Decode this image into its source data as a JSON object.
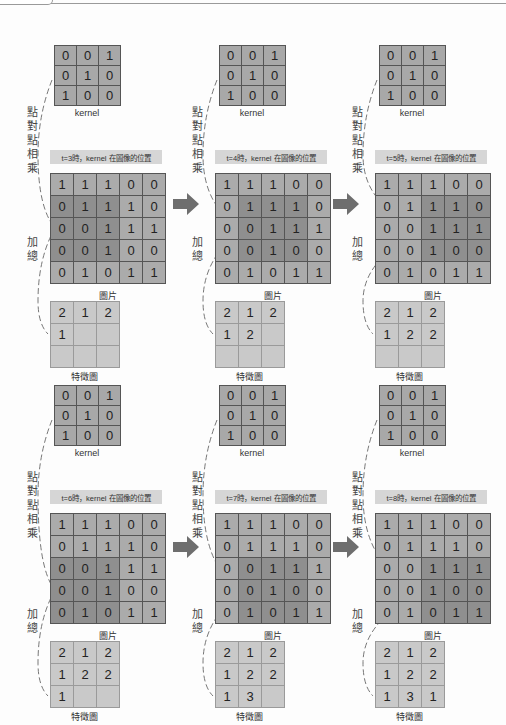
{
  "labels": {
    "kernel": "kernel",
    "image": "圖片",
    "feature_map": "特徵圖",
    "multiply": [
      "點",
      "對",
      "點",
      "相",
      "乘"
    ],
    "sum": [
      "加",
      "總"
    ]
  },
  "kernel_values": [
    [
      0,
      0,
      1
    ],
    [
      0,
      1,
      0
    ],
    [
      1,
      0,
      0
    ]
  ],
  "image_values": [
    [
      1,
      1,
      1,
      0,
      0
    ],
    [
      0,
      1,
      1,
      1,
      0
    ],
    [
      0,
      0,
      1,
      1,
      1
    ],
    [
      0,
      0,
      1,
      0,
      0
    ],
    [
      0,
      1,
      0,
      1,
      1
    ]
  ],
  "colors": {
    "kernel_cell": "#a8a8a8",
    "image_cell": "#ababab",
    "image_highlight": "#8f8f8f",
    "feature_cell": "#c9c9c9",
    "caption_bg": "#d6d6d6",
    "arrow": "#6e6e6e"
  },
  "panels": [
    {
      "caption": "t=3時，kernel 在圖像的位置",
      "window": [
        1,
        0
      ],
      "feature": [
        [
          "2",
          "1",
          "2"
        ],
        [
          "1",
          "",
          ""
        ],
        [
          "",
          "",
          ""
        ]
      ]
    },
    {
      "caption": "t=4時，kernel 在圖像的位置",
      "window": [
        1,
        1
      ],
      "feature": [
        [
          "2",
          "1",
          "2"
        ],
        [
          "1",
          "2",
          ""
        ],
        [
          "",
          "",
          ""
        ]
      ]
    },
    {
      "caption": "t=5時，kernel 在圖像的位置",
      "window": [
        1,
        2
      ],
      "feature": [
        [
          "2",
          "1",
          "2"
        ],
        [
          "1",
          "2",
          "2"
        ],
        [
          "",
          "",
          ""
        ]
      ]
    },
    {
      "caption": "t=6時，kernel 在圖像的位置",
      "window": [
        2,
        0
      ],
      "feature": [
        [
          "2",
          "1",
          "2"
        ],
        [
          "1",
          "2",
          "2"
        ],
        [
          "1",
          "",
          ""
        ]
      ]
    },
    {
      "caption": "t=7時，kernel 在圖像的位置",
      "window": [
        2,
        1
      ],
      "feature": [
        [
          "2",
          "1",
          "2"
        ],
        [
          "1",
          "2",
          "2"
        ],
        [
          "1",
          "3",
          ""
        ]
      ]
    },
    {
      "caption": "t=8時，kernel 在圖像的位置",
      "window": [
        2,
        2
      ],
      "feature": [
        [
          "2",
          "1",
          "2"
        ],
        [
          "1",
          "2",
          "2"
        ],
        [
          "1",
          "3",
          "1"
        ]
      ]
    }
  ],
  "arrows": [
    "arrow-right",
    "arrow-right",
    "arrow-right",
    "arrow-right"
  ]
}
